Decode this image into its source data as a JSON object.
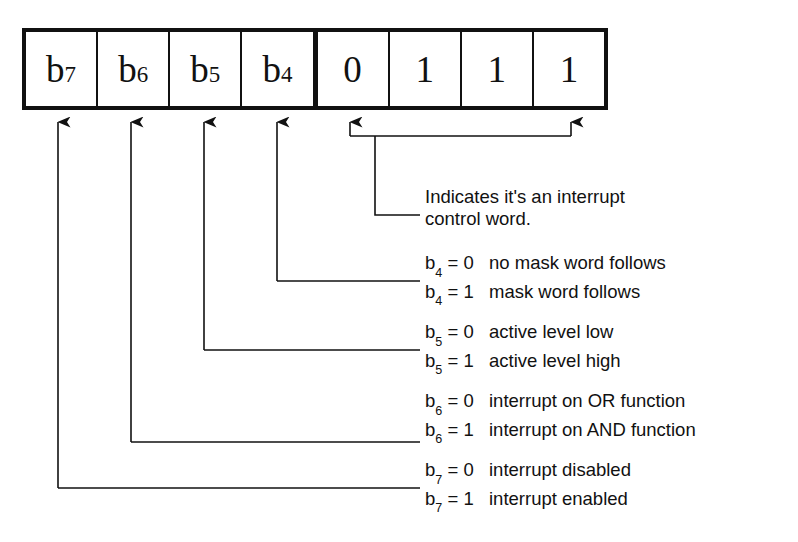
{
  "register": {
    "name": "interrupt-control-word",
    "cells": [
      {
        "label": "b",
        "subscript": "7",
        "kind": "named"
      },
      {
        "label": "b",
        "subscript": "6",
        "kind": "named"
      },
      {
        "label": "b",
        "subscript": "5",
        "kind": "named"
      },
      {
        "label": "b",
        "subscript": "4",
        "kind": "named"
      },
      {
        "label": "0",
        "subscript": "",
        "kind": "fixed"
      },
      {
        "label": "1",
        "subscript": "",
        "kind": "fixed"
      },
      {
        "label": "1",
        "subscript": "",
        "kind": "fixed"
      },
      {
        "label": "1",
        "subscript": "",
        "kind": "fixed"
      }
    ]
  },
  "annotations": {
    "identifier_note": "Indicates it's an interrupt\ncontrol word.",
    "groups": [
      {
        "bit": "b4",
        "lines": [
          {
            "key": "b",
            "sub": "4",
            "eq": " = 0",
            "desc": "no mask word follows"
          },
          {
            "key": "b",
            "sub": "4",
            "eq": " = 1",
            "desc": "mask word follows"
          }
        ]
      },
      {
        "bit": "b5",
        "lines": [
          {
            "key": "b",
            "sub": "5",
            "eq": " = 0",
            "desc": "active level low"
          },
          {
            "key": "b",
            "sub": "5",
            "eq": " = 1",
            "desc": "active level high"
          }
        ]
      },
      {
        "bit": "b6",
        "lines": [
          {
            "key": "b",
            "sub": "6",
            "eq": " = 0",
            "desc": "interrupt on OR function"
          },
          {
            "key": "b",
            "sub": "6",
            "eq": " = 1",
            "desc": "interrupt on AND function"
          }
        ]
      },
      {
        "bit": "b7",
        "lines": [
          {
            "key": "b",
            "sub": "7",
            "eq": " = 0",
            "desc": "interrupt disabled"
          },
          {
            "key": "b",
            "sub": "7",
            "eq": " = 1",
            "desc": "interrupt enabled"
          }
        ]
      }
    ]
  },
  "colors": {
    "ink": "#111111",
    "background": "#ffffff"
  }
}
